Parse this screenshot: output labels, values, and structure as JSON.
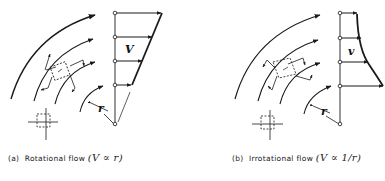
{
  "panels": [
    {
      "id": "a",
      "velocity_label": "V",
      "radius_label": "r",
      "profile": "linear",
      "caption": {
        "prefix": "(a)",
        "text": "Rotational flow",
        "relation": "(V ∝ r)"
      }
    },
    {
      "id": "b",
      "velocity_label": "v",
      "radius_label": "r",
      "profile": "hyperbolic",
      "caption": {
        "prefix": "(b)",
        "text": "Irrotational flow",
        "relation": "(V ∝ 1/r)"
      }
    }
  ],
  "colors": {
    "line": "#1a1a1a",
    "background": "#ffffff"
  }
}
